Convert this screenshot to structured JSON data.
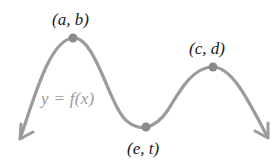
{
  "diagram": {
    "curve_color": "#9b9b9b",
    "point_color": "#8a8a8a",
    "label_color": "#1a1a1a",
    "function_label_color": "#9a9a9a",
    "function_label": "y = f(x)",
    "points": [
      {
        "id": "local-max-1",
        "label": "(a, b)",
        "x": 73,
        "y": 38
      },
      {
        "id": "local-min",
        "label": "(e, t)",
        "x": 146,
        "y": 127
      },
      {
        "id": "local-max-2",
        "label": "(c, d)",
        "x": 213,
        "y": 67
      }
    ],
    "arrows": [
      {
        "id": "left-arrow",
        "direction": "down-left"
      },
      {
        "id": "right-arrow",
        "direction": "down-right"
      }
    ]
  }
}
